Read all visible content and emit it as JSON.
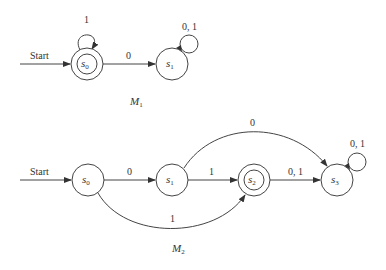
{
  "machines": [
    {
      "name": "M",
      "name_sub": "1",
      "start_label": "Start",
      "states": [
        {
          "id": "s0",
          "label": "s",
          "sub": "0",
          "accepting": true,
          "x": 87,
          "y": 64
        },
        {
          "id": "s1",
          "label": "s",
          "sub": "1",
          "accepting": false,
          "x": 172,
          "y": 64
        }
      ],
      "transitions": [
        {
          "from": "s0",
          "to": "s0",
          "label": "1"
        },
        {
          "from": "s0",
          "to": "s1",
          "label": "0"
        },
        {
          "from": "s1",
          "to": "s1",
          "label": "0, 1"
        }
      ]
    },
    {
      "name": "M",
      "name_sub": "2",
      "start_label": "Start",
      "states": [
        {
          "id": "s0",
          "label": "s",
          "sub": "0",
          "accepting": false,
          "x": 88,
          "y": 180
        },
        {
          "id": "s1",
          "label": "s",
          "sub": "1",
          "accepting": false,
          "x": 172,
          "y": 180
        },
        {
          "id": "s2",
          "label": "s",
          "sub": "2",
          "accepting": true,
          "x": 254,
          "y": 180
        },
        {
          "id": "s3",
          "label": "s",
          "sub": "3",
          "accepting": false,
          "x": 337,
          "y": 180
        }
      ],
      "transitions": [
        {
          "from": "s0",
          "to": "s1",
          "label": "0"
        },
        {
          "from": "s1",
          "to": "s2",
          "label": "1"
        },
        {
          "from": "s2",
          "to": "s3",
          "label": "0, 1"
        },
        {
          "from": "s1",
          "to": "s3",
          "label": "0"
        },
        {
          "from": "s0",
          "to": "s2",
          "label": "1"
        },
        {
          "from": "s3",
          "to": "s3",
          "label": "0, 1"
        }
      ]
    }
  ]
}
